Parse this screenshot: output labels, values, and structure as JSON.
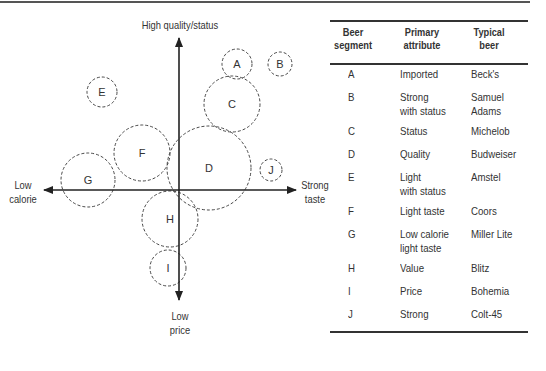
{
  "diagram": {
    "axes": {
      "top": "High quality/status",
      "left": "Low\ncalorie",
      "right": "Strong\ntaste",
      "bottom": "Low\nprice"
    },
    "segments": [
      {
        "id": "A",
        "cx": 237,
        "cy": 64,
        "r": 15
      },
      {
        "id": "B",
        "cx": 280,
        "cy": 64,
        "r": 12
      },
      {
        "id": "C",
        "cx": 232,
        "cy": 104,
        "r": 28
      },
      {
        "id": "D",
        "cx": 209,
        "cy": 168,
        "r": 42
      },
      {
        "id": "E",
        "cx": 102,
        "cy": 92,
        "r": 15
      },
      {
        "id": "F",
        "cx": 142,
        "cy": 153,
        "r": 28
      },
      {
        "id": "G",
        "cx": 88,
        "cy": 180,
        "r": 27
      },
      {
        "id": "H",
        "cx": 170,
        "cy": 219,
        "r": 28
      },
      {
        "id": "I",
        "cx": 168,
        "cy": 268,
        "r": 18
      },
      {
        "id": "J",
        "cx": 271,
        "cy": 170,
        "r": 11
      }
    ],
    "line_color": "#333333"
  },
  "table": {
    "headers": {
      "segment": "Beer\nsegment",
      "attribute": "Primary\nattribute",
      "beer": "Typical\nbeer"
    },
    "rows": [
      {
        "segment": "A",
        "attribute": "Imported",
        "beer": "Beck's"
      },
      {
        "segment": "B",
        "attribute": "Strong\nwith status",
        "beer": "Samuel Adams"
      },
      {
        "segment": "C",
        "attribute": "Status",
        "beer": "Michelob"
      },
      {
        "segment": "D",
        "attribute": "Quality",
        "beer": "Budweiser"
      },
      {
        "segment": "E",
        "attribute": "Light\nwith status",
        "beer": "Amstel"
      },
      {
        "segment": "F",
        "attribute": "Light taste",
        "beer": "Coors"
      },
      {
        "segment": "G",
        "attribute": "Low calorie\nlight taste",
        "beer": "Miller Lite"
      },
      {
        "segment": "H",
        "attribute": "Value",
        "beer": "Blitz"
      },
      {
        "segment": "I",
        "attribute": "Price",
        "beer": "Bohemia"
      },
      {
        "segment": "J",
        "attribute": "Strong",
        "beer": "Colt-45"
      }
    ]
  }
}
